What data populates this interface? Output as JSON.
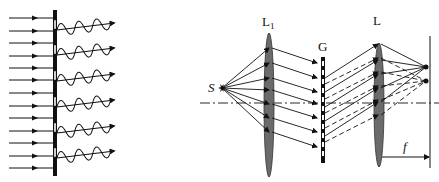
{
  "left_panel": {
    "description": "Plane wave incident on a grating producing diffracted wavelets",
    "incident_rays": 13,
    "slits": 6,
    "wavelets": 6
  },
  "right_panel": {
    "labels": {
      "source": "S",
      "lens1": "L",
      "lens1_sub": "1",
      "grating": "G",
      "lens2": "L",
      "focal": "f"
    },
    "rays_from_source": 7,
    "solid_rays_after_grating": 5,
    "dashed_rays_after_grating": 5
  },
  "colors": {
    "ink": "#111111",
    "lens_fill": "#6b6b6b",
    "background": "#ffffff"
  }
}
